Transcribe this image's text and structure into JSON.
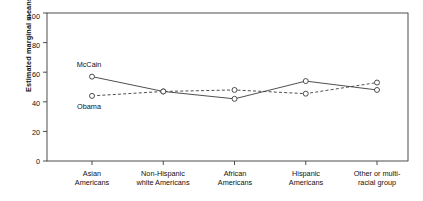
{
  "chart_data": {
    "type": "line",
    "title": "",
    "xlabel": "",
    "ylabel": "Estimated marginal means",
    "ylim": [
      0,
      100
    ],
    "yticks": [
      0,
      20,
      40,
      60,
      80,
      100
    ],
    "grid": false,
    "legend_position": "inline-annotations",
    "categories": [
      "Asian Americans",
      "Non-Hispanic white Americans",
      "African Americans",
      "Hispanic Americans",
      "Other or multi-racial group"
    ],
    "category_lines": [
      [
        "Asian",
        "Americans"
      ],
      [
        "Non-Hispanic",
        "white Americans"
      ],
      [
        "African",
        "Americans"
      ],
      [
        "Hispanic",
        "Americans"
      ],
      [
        "Other or multi-",
        "racial group"
      ]
    ],
    "series": [
      {
        "name": "McCain",
        "style": "solid",
        "marker": "open-circle",
        "values": [
          57,
          47,
          42,
          54,
          48
        ]
      },
      {
        "name": "Obama",
        "style": "dashed",
        "marker": "open-circle",
        "values": [
          44,
          47,
          48,
          45.5,
          53
        ]
      }
    ],
    "annotations": [
      {
        "text": "McCain",
        "series": "McCain",
        "position": "above-first-point"
      },
      {
        "text": "Obama",
        "series": "Obama",
        "position": "below-first-point"
      }
    ],
    "colors": {
      "line": "#3b3b3b",
      "marker_fill": "#ffffff",
      "axis": "#3b3b3b",
      "text": "#111111",
      "background": "#ffffff"
    }
  }
}
